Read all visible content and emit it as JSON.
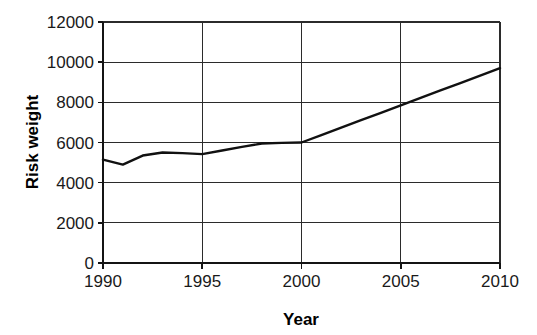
{
  "chart_data": {
    "type": "line",
    "title": "",
    "subtitle": "",
    "xlabel": "Year",
    "ylabel": "Risk weight",
    "xlim": [
      1990,
      2010
    ],
    "ylim": [
      0,
      12000
    ],
    "grid": true,
    "legend": false,
    "legend_position": "none",
    "x_ticks": [
      1990,
      1995,
      2000,
      2005,
      2010
    ],
    "x_tick_labels": [
      "1990",
      "1995",
      "2000",
      "2005",
      "2010"
    ],
    "y_ticks": [
      0,
      2000,
      4000,
      6000,
      8000,
      10000,
      12000
    ],
    "y_tick_labels": [
      "0",
      "2000",
      "4000",
      "6000",
      "8000",
      "10000",
      "12000"
    ],
    "series": [
      {
        "name": "Risk weight",
        "color": "#111111",
        "x": [
          1990,
          1991,
          1992,
          1993,
          1994,
          1995,
          1996,
          1997,
          1998,
          1999,
          2000,
          2001,
          2002,
          2003,
          2004,
          2005,
          2006,
          2007,
          2008,
          2009,
          2010
        ],
        "values": [
          5150,
          4900,
          5350,
          5500,
          5470,
          5420,
          5600,
          5780,
          5950,
          5980,
          6000,
          6370,
          6740,
          7110,
          7480,
          7850,
          8220,
          8590,
          8960,
          9330,
          9700
        ]
      }
    ]
  },
  "labels": {
    "x_axis_title": "Year",
    "y_axis_title": "Risk weight"
  },
  "colors": {
    "series": "#111111",
    "grid": "#2b2b2b",
    "axis": "#141414",
    "background": "#ffffff",
    "text": "#1a1a1a"
  }
}
